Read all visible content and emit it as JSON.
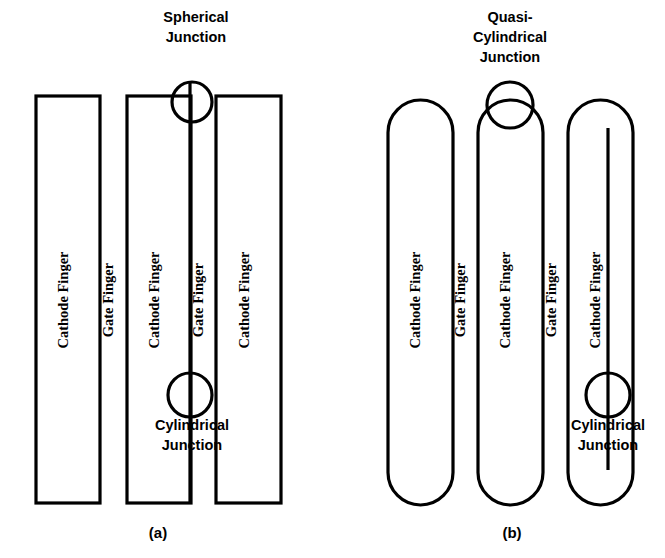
{
  "figure": {
    "background_color": "#ffffff",
    "stroke_color": "#000000",
    "panels": [
      {
        "id": "panel-a",
        "caption": "(a)",
        "caption_x": 158,
        "caption_y": 538,
        "junction_top_label_lines": [
          "Spherical",
          "Junction"
        ],
        "junction_top_label_x": 196,
        "junction_top_label_y": 22,
        "junction_bottom_label_lines": [
          "Cylindrical",
          "Junction"
        ],
        "junction_bottom_label_x": 192,
        "junction_bottom_label_y": 430,
        "finger_style": "rectangular",
        "fingers": [
          {
            "label": "Cathode Finger",
            "kind": "cathode",
            "x": 36,
            "y": 96,
            "width": 64,
            "height": 407,
            "label_x": 68,
            "label_y": 300
          },
          {
            "label": "Gate Finger",
            "kind": "gate",
            "x": 113,
            "y": 96,
            "width": 0,
            "height": 407,
            "label_x": 113,
            "label_y": 300
          },
          {
            "label": "Cathode Finger",
            "kind": "cathode",
            "x": 127,
            "y": 96,
            "width": 64,
            "height": 407,
            "label_x": 159,
            "label_y": 300
          },
          {
            "label": "Gate Finger",
            "kind": "gate",
            "x": 203,
            "y": 96,
            "width": 0,
            "height": 407,
            "label_x": 203,
            "label_y": 300
          },
          {
            "label": "Cathode Finger",
            "kind": "cathode",
            "x": 216,
            "y": 96,
            "width": 65,
            "height": 407,
            "label_x": 249,
            "label_y": 300
          }
        ],
        "gate_lines": [
          {
            "x": 190,
            "y1": 82,
            "y2": 503
          }
        ],
        "junction_circles": [
          {
            "name": "spherical-junction-circle",
            "cx": 192,
            "cy": 102,
            "r": 20
          },
          {
            "name": "cylindrical-junction-circle",
            "cx": 190,
            "cy": 395,
            "r": 22
          }
        ]
      },
      {
        "id": "panel-b",
        "caption": "(b)",
        "caption_x": 512,
        "caption_y": 538,
        "junction_top_label_lines": [
          "Quasi-",
          "Cylindrical",
          "Junction"
        ],
        "junction_top_label_x": 510,
        "junction_top_label_y": 22,
        "junction_bottom_label_lines": [
          "Cylindrical",
          "Junction"
        ],
        "junction_bottom_label_x": 608,
        "junction_bottom_label_y": 430,
        "finger_style": "rounded",
        "fingers": [
          {
            "label": "Cathode Finger",
            "kind": "cathode",
            "x": 388,
            "y": 100,
            "width": 65,
            "height": 405,
            "label_x": 420,
            "label_y": 300
          },
          {
            "label": "Gate Finger",
            "kind": "gate",
            "x": 465,
            "y": 100,
            "width": 0,
            "height": 405,
            "label_x": 465,
            "label_y": 300
          },
          {
            "label": "Cathode Finger",
            "kind": "cathode",
            "x": 478,
            "y": 100,
            "width": 65,
            "height": 405,
            "label_x": 510,
            "label_y": 300
          },
          {
            "label": "Gate Finger",
            "kind": "gate",
            "x": 556,
            "y": 100,
            "width": 0,
            "height": 405,
            "label_x": 556,
            "label_y": 300
          },
          {
            "label": "Cathode Finger",
            "kind": "cathode",
            "x": 568,
            "y": 100,
            "width": 65,
            "height": 405,
            "label_x": 600,
            "label_y": 300
          }
        ],
        "gate_lines": [
          {
            "x": 608,
            "y1": 128,
            "y2": 470
          }
        ],
        "junction_circles": [
          {
            "name": "quasi-cylindrical-junction-circle",
            "cx": 510,
            "cy": 105,
            "r": 23
          },
          {
            "name": "cylindrical-junction-circle",
            "cx": 608,
            "cy": 395,
            "r": 22
          }
        ]
      }
    ]
  }
}
